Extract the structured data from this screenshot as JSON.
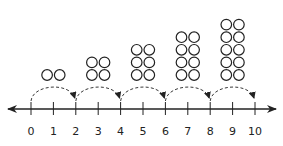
{
  "diagram": {
    "type": "number-line-skip-count",
    "colors": {
      "ink": "#222222",
      "background": "#ffffff"
    },
    "number_line": {
      "min": 0,
      "max": 10,
      "step": 1,
      "tick_labels": [
        "0",
        "1",
        "2",
        "3",
        "4",
        "5",
        "6",
        "7",
        "8",
        "9",
        "10"
      ],
      "arrows_both_ends": true
    },
    "jumps": [
      {
        "from": 0,
        "to": 2
      },
      {
        "from": 2,
        "to": 4
      },
      {
        "from": 4,
        "to": 6
      },
      {
        "from": 6,
        "to": 8
      },
      {
        "from": 8,
        "to": 10
      }
    ],
    "counter_groups": [
      {
        "over_segment": [
          0,
          2
        ],
        "rows": 1,
        "cols": 2,
        "count": 2
      },
      {
        "over_segment": [
          2,
          4
        ],
        "rows": 2,
        "cols": 2,
        "count": 4
      },
      {
        "over_segment": [
          4,
          6
        ],
        "rows": 3,
        "cols": 2,
        "count": 6
      },
      {
        "over_segment": [
          6,
          8
        ],
        "rows": 4,
        "cols": 2,
        "count": 8
      },
      {
        "over_segment": [
          8,
          10
        ],
        "rows": 5,
        "cols": 2,
        "count": 10
      }
    ]
  }
}
